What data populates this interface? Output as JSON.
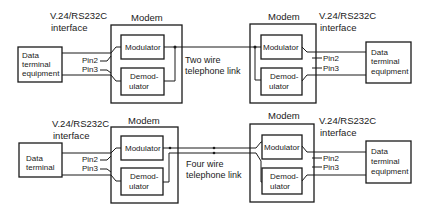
{
  "diagrams": [
    {
      "id": "two-wire",
      "left_interface": {
        "line1": "V.24/RS232C",
        "line2": "interface"
      },
      "right_interface": {
        "line1": "V.24/RS232C",
        "line2": "interface"
      },
      "left_dte": {
        "lines": [
          "Data",
          "terminal",
          "equipment"
        ]
      },
      "right_dte": {
        "lines": [
          "Data",
          "terminal",
          "equipment"
        ]
      },
      "left_modem": {
        "title": "Modem",
        "modulator": "Modulator",
        "demod_line1": "Demod-",
        "demod_line2": "ulator"
      },
      "right_modem": {
        "title": "Modem",
        "modulator": "Modulator",
        "demod_line1": "Demod-",
        "demod_line2": "ulator"
      },
      "pins": {
        "pin2": "Pin2",
        "pin3": "Pin3"
      },
      "link": {
        "line1": "Two wire",
        "line2": "telephone link"
      }
    },
    {
      "id": "four-wire",
      "left_interface": {
        "line1": "V.24/RS232C",
        "line2": "interface"
      },
      "right_interface": {
        "line1": "V.24/RS232C",
        "line2": "interface"
      },
      "left_dte": {
        "lines": [
          "Data",
          "terminal"
        ]
      },
      "right_dte": {
        "lines": [
          "Data",
          "terminal",
          "equipment"
        ]
      },
      "left_modem": {
        "title": "Modem",
        "modulator": "Modulator",
        "demod_line1": "Demod-",
        "demod_line2": "ulator"
      },
      "right_modem": {
        "title": "Modem",
        "modulator": "Modulator",
        "demod_line1": "Demod-",
        "demod_line2": "ulator"
      },
      "pins": {
        "pin2": "Pin2",
        "pin3": "Pin3"
      },
      "link": {
        "line1": "Four wire",
        "line2": "telephone link"
      }
    }
  ],
  "colors": {
    "ink": "#1a1a1a",
    "background": "#ffffff"
  }
}
